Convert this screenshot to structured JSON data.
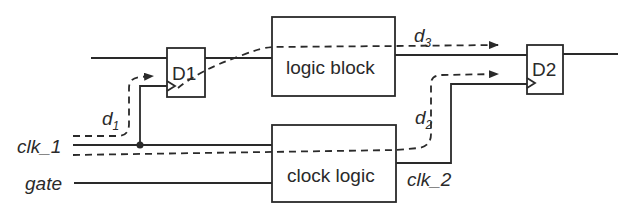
{
  "diagram": {
    "blocks": {
      "d1": {
        "label": "D1"
      },
      "d2": {
        "label": "D2"
      },
      "logic_block": {
        "label": "logic block"
      },
      "clock_logic": {
        "label": "clock logic"
      }
    },
    "signals": {
      "clk1": {
        "label": "clk_1"
      },
      "gate": {
        "label": "gate"
      },
      "clk2": {
        "label": "clk_2"
      }
    },
    "delays": {
      "d1": {
        "base": "d",
        "sub": "1"
      },
      "d2": {
        "base": "d",
        "sub": "2"
      },
      "d3": {
        "base": "d",
        "sub": "3"
      }
    },
    "colors": {
      "line": "#2a2a2a",
      "background": "#ffffff"
    }
  }
}
